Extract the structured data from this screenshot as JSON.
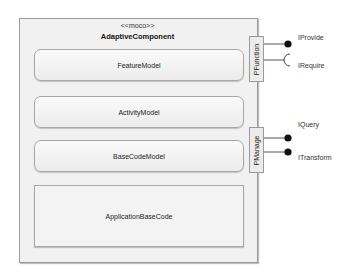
{
  "component": {
    "stereotype": "<<moco>>",
    "name": "AdaptiveComponent"
  },
  "parts": [
    {
      "label": "FeatureModel",
      "shape": "rounded"
    },
    {
      "label": "ActivityModel",
      "shape": "rounded"
    },
    {
      "label": "BaseCodeModel",
      "shape": "rounded"
    },
    {
      "label": "ApplicationBaseCode",
      "shape": "square"
    }
  ],
  "ports": [
    {
      "label": "PFunction",
      "interfaces": [
        {
          "label": "IProvide",
          "kind": "provided-ball"
        },
        {
          "label": "IRequire",
          "kind": "required-socket"
        }
      ]
    },
    {
      "label": "PManage",
      "interfaces": [
        {
          "label": "IQuery",
          "kind": "provided-ball"
        },
        {
          "label": "ITransform",
          "kind": "provided-ball"
        }
      ]
    }
  ],
  "colors": {
    "border": "#9a9a9a",
    "fill": "#f1f1f1",
    "connector": "#555555",
    "ball": "#111111"
  }
}
